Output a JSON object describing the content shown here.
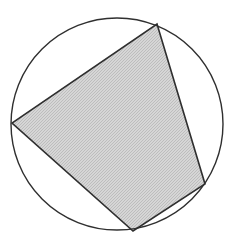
{
  "diagram": {
    "type": "cyclic-quadrilateral",
    "colors": {
      "background": "#ffffff",
      "stroke": "#2f2f2f",
      "fill": "#d6d6d6",
      "fill_stipple": "#bdbdbd"
    },
    "circle": {
      "cx": 117,
      "cy": 124,
      "r": 106
    },
    "quadrilateral": {
      "vertices": [
        {
          "x": 157,
          "y": 24
        },
        {
          "x": 205,
          "y": 184
        },
        {
          "x": 133,
          "y": 231
        },
        {
          "x": 12,
          "y": 123
        }
      ]
    }
  }
}
